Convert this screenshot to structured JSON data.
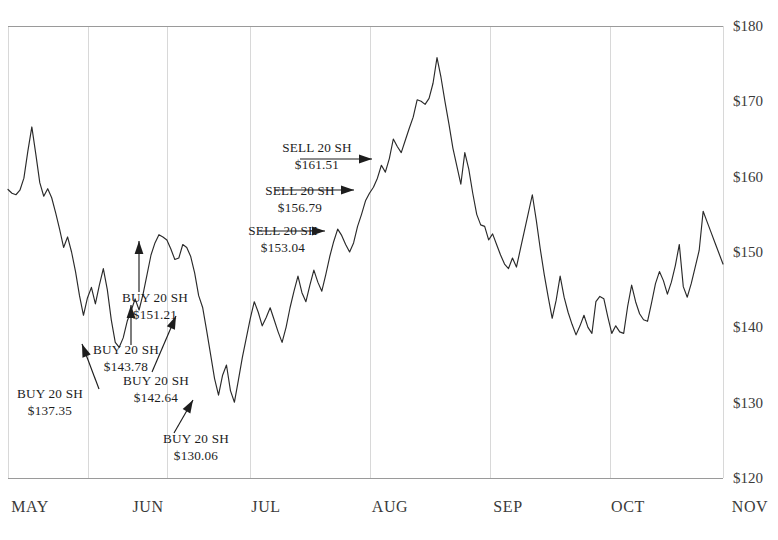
{
  "chart_data": {
    "type": "line",
    "title": "",
    "xlabel": "",
    "ylabel": "",
    "ylim": [
      120,
      180
    ],
    "y_ticks": [
      120,
      130,
      140,
      150,
      160,
      170,
      180
    ],
    "y_tick_labels": [
      "$120",
      "$130",
      "$140",
      "$150",
      "$160",
      "$170",
      "$180"
    ],
    "x_ticks": [
      "MAY",
      "JUN",
      "JUL",
      "AUG",
      "SEP",
      "OCT",
      "NOV"
    ],
    "x_tick_labels": [
      "MAY",
      "JUN",
      "JUL",
      "AUG",
      "SEP",
      "OCT",
      "NOV"
    ],
    "grid": true,
    "grid_axis": "x",
    "legend": "none",
    "series": [
      {
        "name": "price",
        "color": "#2a2a2a",
        "values": [
          158.3,
          157.8,
          157.6,
          158.2,
          159.8,
          163.4,
          166.6,
          163.0,
          159.2,
          157.4,
          158.4,
          157.2,
          155.2,
          153.0,
          150.6,
          152.0,
          150.0,
          147.4,
          144.2,
          141.6,
          143.9,
          145.3,
          143.1,
          145.6,
          147.8,
          145.0,
          141.0,
          138.0,
          137.35,
          138.6,
          140.8,
          142.2,
          143.78,
          142.3,
          144.4,
          147.0,
          149.6,
          151.21,
          152.3,
          152.0,
          151.6,
          150.4,
          149.0,
          149.2,
          151.0,
          150.6,
          149.4,
          147.2,
          144.2,
          142.64,
          139.6,
          136.4,
          133.2,
          131.0,
          133.6,
          135.0,
          131.6,
          130.06,
          133.0,
          136.0,
          138.6,
          141.2,
          143.4,
          142.0,
          140.2,
          141.3,
          142.6,
          141.0,
          139.4,
          138.0,
          140.0,
          142.6,
          144.8,
          146.8,
          144.6,
          143.4,
          145.6,
          147.6,
          146.0,
          144.8,
          147.0,
          149.4,
          151.4,
          153.04,
          152.2,
          151.0,
          150.0,
          151.2,
          153.4,
          155.0,
          156.79,
          157.8,
          158.6,
          159.8,
          161.51,
          160.6,
          162.4,
          165.0,
          164.0,
          163.2,
          164.8,
          166.4,
          167.9,
          170.2,
          170.0,
          169.6,
          170.4,
          172.4,
          175.8,
          173.2,
          170.0,
          167.0,
          163.8,
          161.4,
          159.0,
          163.2,
          161.0,
          157.8,
          155.0,
          153.6,
          153.4,
          151.6,
          152.4,
          151.0,
          149.6,
          148.4,
          147.8,
          149.2,
          148.0,
          150.4,
          152.8,
          155.2,
          157.6,
          154.2,
          150.4,
          147.0,
          144.0,
          141.2,
          143.6,
          146.8,
          144.0,
          142.0,
          140.4,
          139.0,
          140.2,
          141.6,
          140.0,
          139.2,
          143.4,
          144.1,
          143.8,
          141.4,
          139.2,
          140.2,
          139.4,
          139.2,
          142.8,
          145.6,
          143.4,
          141.8,
          141.0,
          140.8,
          143.2,
          145.8,
          147.4,
          146.2,
          144.4,
          146.0,
          148.2,
          151.0,
          145.4,
          144.0,
          145.8,
          148.0,
          150.2,
          155.4,
          154.0,
          152.6,
          151.2,
          149.8,
          148.4
        ]
      }
    ],
    "annotations": [
      {
        "id": "buy-1",
        "kind": "buy",
        "action": "BUY 20 SH",
        "price": "$137.35",
        "value": 137.35,
        "text_x": 50,
        "text_y": 398,
        "tip_x": 82,
        "tip_y": 344,
        "tail_x": 99,
        "tail_y": 389,
        "align": "middle"
      },
      {
        "id": "buy-2",
        "kind": "buy",
        "action": "BUY 20 SH",
        "price": "$143.78",
        "value": 143.78,
        "text_x": 126,
        "text_y": 354,
        "tip_x": 131,
        "tip_y": 305,
        "tail_x": 131,
        "tail_y": 345,
        "align": "middle"
      },
      {
        "id": "buy-3",
        "kind": "buy",
        "action": "BUY 20 SH",
        "price": "$151.21",
        "value": 151.21,
        "text_x": 155,
        "text_y": 302,
        "tip_x": 139,
        "tip_y": 241,
        "tail_x": 139,
        "tail_y": 292,
        "align": "middle"
      },
      {
        "id": "buy-4",
        "kind": "buy",
        "action": "BUY 20 SH",
        "price": "$142.64",
        "value": 142.64,
        "text_x": 156,
        "text_y": 385,
        "tip_x": 176,
        "tip_y": 316,
        "tail_x": 152,
        "tail_y": 372,
        "align": "middle"
      },
      {
        "id": "buy-5",
        "kind": "buy",
        "action": "BUY 20 SH",
        "price": "$130.06",
        "value": 130.06,
        "text_x": 196,
        "text_y": 443,
        "tip_x": 193,
        "tip_y": 400,
        "tail_x": 174,
        "tail_y": 433,
        "align": "middle"
      },
      {
        "id": "sell-1",
        "kind": "sell",
        "action": "SELL 20 SH",
        "price": "$153.04",
        "value": 153.04,
        "text_x": 283,
        "text_y": 235,
        "tip_x": 325,
        "tip_y": 231,
        "tail_x": 259,
        "tail_y": 231,
        "align": "middle"
      },
      {
        "id": "sell-2",
        "kind": "sell",
        "action": "SELL 20 SH",
        "price": "$156.79",
        "value": 156.79,
        "text_x": 300,
        "text_y": 195,
        "tip_x": 354,
        "tip_y": 190,
        "tail_x": 275,
        "tail_y": 190,
        "align": "middle"
      },
      {
        "id": "sell-3",
        "kind": "sell",
        "action": "SELL 20 SH",
        "price": "$161.51",
        "value": 161.51,
        "text_x": 317,
        "text_y": 152,
        "tip_x": 372,
        "tip_y": 159,
        "tail_x": 300,
        "tail_y": 159,
        "align": "middle"
      }
    ]
  },
  "plot": {
    "left": 8,
    "right": 723,
    "top": 26,
    "bottom": 478,
    "x_gridlines": [
      8,
      88,
      167,
      250,
      370,
      490,
      610,
      723
    ],
    "month_label_x": [
      30,
      148,
      266,
      390,
      508,
      628,
      750
    ],
    "month_label_y": 512,
    "y_label_x": 733,
    "background": "#ffffff",
    "line_color": "#2a2a2a",
    "grid_color": "#d8d8d8",
    "axis_color": "#9a9a9a",
    "text_color": "#2b2b2b"
  }
}
